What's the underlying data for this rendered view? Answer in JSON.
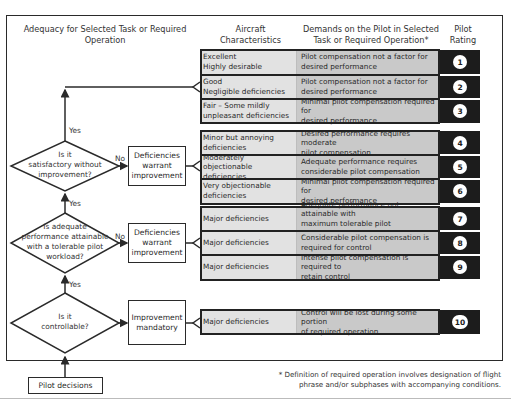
{
  "headers": {
    "adequacy": "Adequacy for Selected Task or Required Operation",
    "aircraft": "Aircraft Characteristics",
    "demands": "Demands on the Pilot in Selected Task or Required Operation*",
    "rating": "Pilot Rating"
  },
  "rows": [
    {
      "char1": "Excellent",
      "char2": "Highly desirable",
      "demand1": "Pilot compensation not a factor for",
      "demand2": "desired performance",
      "rating": "1"
    },
    {
      "char1": "Good",
      "char2": "Negligible deficiencies",
      "demand1": "Pilot compensation not a factor for",
      "demand2": "desired performance",
      "rating": "2"
    },
    {
      "char1": "Fair – Some mildly",
      "char2": "unpleasant deficiencies",
      "demand1": "Minimal pilot compensation required for",
      "demand2": "desired performance",
      "rating": "3"
    },
    {
      "char1": "Minor but annoying",
      "char2": "deficiencies",
      "demand1": "Desired performance requires moderate",
      "demand2": "pilot compensation",
      "rating": "4"
    },
    {
      "char1": "Moderately objectionable",
      "char2": "deficiencies",
      "demand1": "Adequate performance requires",
      "demand2": "considerable pilot compensation",
      "rating": "5"
    },
    {
      "char1": "Very objectionable",
      "char2": "deficiencies",
      "demand1": "Minimal pilot compensation required for",
      "demand2": "desired performance",
      "rating": "6"
    },
    {
      "char1": "Major deficiencies",
      "char2": "",
      "demand1": "Adequate performance not attainable with",
      "demand2": "maximum tolerable pilot compensation",
      "rating": "7"
    },
    {
      "char1": "Major deficiencies",
      "char2": "",
      "demand1": "Considerable pilot compensation is",
      "demand2": "required for control",
      "rating": "8"
    },
    {
      "char1": "Major deficiencies",
      "char2": "",
      "demand1": "Intense pilot compensation is required to",
      "demand2": "retain control",
      "rating": "9"
    },
    {
      "char1": "Major deficiencies",
      "char2": "",
      "demand1": "Control will be lost during some portion",
      "demand2": "of required operation",
      "rating": "10"
    }
  ],
  "decisions": [
    {
      "q1": "Is it",
      "q2": "satisfactory without",
      "q3": "improvement?",
      "q4": "",
      "no_label": "No",
      "yes_label": "Yes",
      "box1": "Deficiencies",
      "box2": "warrant",
      "box3": "improvement"
    },
    {
      "q1": "Is adequate",
      "q2": "performance attainable",
      "q3": "with a tolerable pilot",
      "q4": "workload?",
      "no_label": "No",
      "yes_label": "Yes",
      "box1": "Deficiencies",
      "box2": "warrant",
      "box3": "improvement"
    },
    {
      "q1": "Is it",
      "q2": "controllable?",
      "q3": "",
      "q4": "",
      "no_label": "",
      "yes_label": "Yes",
      "box1": "Improvement",
      "box2": "mandatory",
      "box3": ""
    }
  ],
  "start_box": "Pilot decisions",
  "footnote": {
    "line1": "* Definition of required operation involves designation of flight",
    "line2": "phrase and/or subphases with accompanying conditions."
  },
  "colors": {
    "char_cell": "#e2e2e2",
    "demand_cell": "#c9c9c9",
    "rating_cell": "#1c1c1c",
    "line": "#2a2a2a"
  }
}
